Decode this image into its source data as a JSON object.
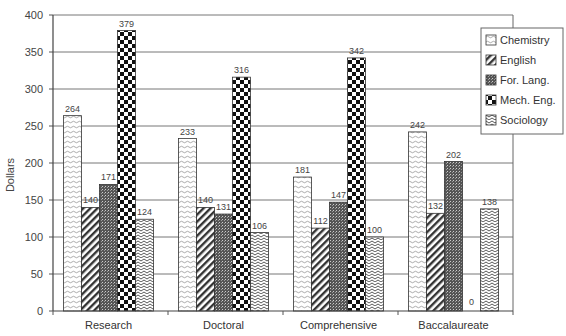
{
  "chart_data": {
    "type": "bar",
    "title": "",
    "xlabel": "",
    "ylabel": "Dollars",
    "ylim": [
      0,
      400
    ],
    "yticks": [
      0,
      50,
      100,
      150,
      200,
      250,
      300,
      350,
      400
    ],
    "grid": true,
    "legend_position": "upper right",
    "categories": [
      "Research",
      "Doctoral",
      "Comprehensive",
      "Baccalaureate"
    ],
    "series": [
      {
        "name": "Chemistry",
        "pattern": "dotted-wave",
        "values": [
          264,
          233,
          181,
          242
        ]
      },
      {
        "name": "English",
        "pattern": "diagonal-hatch",
        "values": [
          140,
          140,
          112,
          132
        ]
      },
      {
        "name": "For. Lang.",
        "pattern": "dense-vertical",
        "values": [
          171,
          131,
          147,
          202
        ]
      },
      {
        "name": "Mech. Eng.",
        "pattern": "checkerboard",
        "values": [
          379,
          316,
          342,
          0
        ]
      },
      {
        "name": "Sociology",
        "pattern": "zigzag",
        "values": [
          124,
          106,
          100,
          138
        ]
      }
    ],
    "data_labels_shown": {
      "Research": [
        "264",
        "140",
        "171",
        "379",
        "124"
      ],
      "Doctoral": [
        "233",
        "140",
        "131",
        "316",
        "106"
      ],
      "Comprehensive": [
        "181",
        "112",
        "147",
        "342",
        "100"
      ],
      "Baccalaureate": [
        "242",
        "132",
        "202",
        "0",
        "138"
      ]
    }
  }
}
